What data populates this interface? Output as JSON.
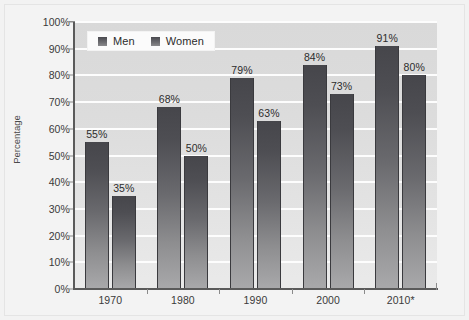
{
  "chart_data": {
    "type": "bar",
    "title": "",
    "subtitle": "",
    "xlabel": "",
    "ylabel": "Percentage",
    "categories": [
      "1970",
      "1980",
      "1990",
      "2000",
      "2010*"
    ],
    "series": [
      {
        "name": "Men",
        "values": [
          55,
          68,
          79,
          84,
          91
        ],
        "labels": [
          "55%",
          "68%",
          "79%",
          "84%",
          "91%"
        ]
      },
      {
        "name": "Women",
        "values": [
          35,
          50,
          63,
          73,
          80
        ],
        "labels": [
          "35%",
          "50%",
          "63%",
          "73%",
          "80%"
        ]
      }
    ],
    "ylim": [
      0,
      100
    ],
    "ytick_values": [
      0,
      10,
      20,
      30,
      40,
      50,
      60,
      70,
      80,
      90,
      100
    ],
    "ytick_labels": [
      "0%",
      "10%",
      "20%",
      "30%",
      "40%",
      "50%",
      "60%",
      "70%",
      "80%",
      "90%",
      "100%"
    ],
    "grid": "horizontal",
    "legend_position": "top-left-inside",
    "bar_color": "#5b5b60",
    "plot_background": "#dedede",
    "gridline_color": "#fdfdfd",
    "axis_color": "#5a5a5a",
    "text_color": "#2c2c2c"
  },
  "legend": {
    "items": [
      {
        "label": "Men"
      },
      {
        "label": "Women"
      }
    ]
  }
}
